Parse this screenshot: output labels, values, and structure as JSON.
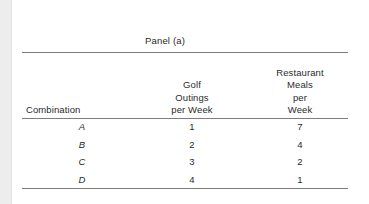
{
  "panel": {
    "title": "Panel (a)",
    "table": {
      "headers": [
        {
          "id": "combination",
          "lines": [
            "Combination"
          ],
          "align": "left"
        },
        {
          "id": "golf-outings-per-week",
          "lines": [
            "Golf",
            "Outings",
            "per Week"
          ],
          "align": "center"
        },
        {
          "id": "restaurant-meals-per-week",
          "lines": [
            "Restaurant",
            "Meals",
            "per",
            "Week"
          ],
          "align": "center"
        }
      ],
      "rows": [
        {
          "combination": "A",
          "golf_outings_per_week": "1",
          "restaurant_meals_per_week": "7"
        },
        {
          "combination": "B",
          "golf_outings_per_week": "2",
          "restaurant_meals_per_week": "4"
        },
        {
          "combination": "C",
          "golf_outings_per_week": "3",
          "restaurant_meals_per_week": "2"
        },
        {
          "combination": "D",
          "golf_outings_per_week": "4",
          "restaurant_meals_per_week": "1"
        }
      ]
    }
  },
  "chart_data": {
    "type": "table",
    "title": "Panel (a)",
    "columns": [
      "Combination",
      "Golf Outings per Week",
      "Restaurant Meals per Week"
    ],
    "categories": [
      "A",
      "B",
      "C",
      "D"
    ],
    "series": [
      {
        "name": "Golf Outings per Week",
        "values": [
          1,
          2,
          3,
          4
        ]
      },
      {
        "name": "Restaurant Meals per Week",
        "values": [
          7,
          4,
          2,
          1
        ]
      }
    ],
    "xlabel": "Combination",
    "ylabel": "",
    "grid": false,
    "legend": "none"
  },
  "colors": {
    "rule": "#7d7d7d",
    "text": "#2b2b2b",
    "page_edge": "#ededed",
    "background": "#ffffff"
  }
}
